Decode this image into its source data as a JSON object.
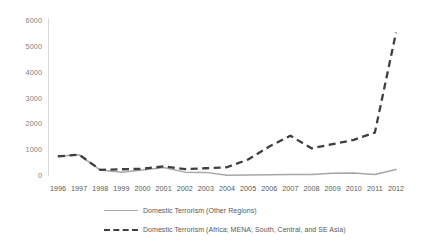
{
  "chart_data": {
    "type": "line",
    "title": "",
    "xlabel": "",
    "ylabel": "",
    "x": [
      1996,
      1997,
      1998,
      1999,
      2000,
      2001,
      2002,
      2003,
      2004,
      2005,
      2006,
      2007,
      2008,
      2009,
      2010,
      2011,
      2012
    ],
    "categories": [
      "1996",
      "1997",
      "1998",
      "1999",
      "2000",
      "2001",
      "2002",
      "2003",
      "2004",
      "2005",
      "2006",
      "2007",
      "2008",
      "2009",
      "2010",
      "2011",
      "2012"
    ],
    "series": [
      {
        "name": "Domestic Terrorism (Other Regions)",
        "style": "solid",
        "color": "#a6a6a6",
        "values": [
          760,
          820,
          230,
          150,
          230,
          330,
          150,
          140,
          30,
          40,
          50,
          55,
          60,
          110,
          115,
          60,
          250
        ]
      },
      {
        "name": "Domestic Terrorism (Africa; MENA; South, Central, and SE Asia)",
        "style": "dashed",
        "color": "#3f3f3f",
        "values": [
          760,
          830,
          240,
          260,
          280,
          370,
          270,
          300,
          340,
          640,
          1140,
          1560,
          1070,
          1230,
          1400,
          1680,
          5550
        ]
      }
    ],
    "ylim": [
      0,
      6000
    ],
    "yticks": [
      0,
      1000,
      2000,
      3000,
      4000,
      5000,
      6000
    ],
    "ytick_labels": [
      "0",
      "1000",
      "2000",
      "3000",
      "4000",
      "5000",
      "6000"
    ],
    "grid": false,
    "legend_position": "bottom"
  },
  "legend": {
    "entries": [
      {
        "label": "Domestic Terrorism (Other Regions)",
        "style": "solid"
      },
      {
        "label": "Domestic Terrorism (Africa; MENA; South, Central, and SE Asia)",
        "style": "dashed"
      }
    ]
  }
}
